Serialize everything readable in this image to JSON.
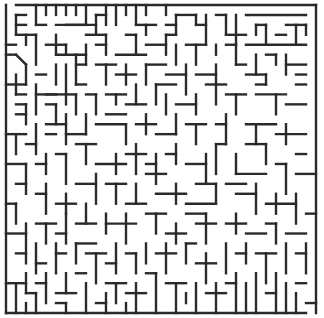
{
  "maze": {
    "origin": [
      6,
      5
    ],
    "cell": 10,
    "cols": 31,
    "rows": 31,
    "wall_color": "#2a2a2a",
    "entrance": {
      "side": "top",
      "col": 0
    },
    "exit": {
      "side": "bottom",
      "col": 30
    },
    "walls": [
      [
        1,
        0,
        31,
        0
      ],
      [
        31,
        0,
        31,
        31
      ],
      [
        0,
        0,
        0,
        31
      ],
      [
        0,
        31,
        30,
        31
      ],
      [
        1,
        1,
        2,
        1
      ],
      [
        1,
        1,
        1,
        3
      ],
      [
        1,
        2,
        2,
        2
      ],
      [
        1,
        3,
        3,
        3
      ],
      [
        3,
        0,
        3,
        2
      ],
      [
        3,
        2,
        4,
        2
      ],
      [
        4,
        0,
        4,
        1
      ],
      [
        5,
        0,
        5,
        1
      ],
      [
        6,
        0,
        6,
        1
      ],
      [
        7,
        0,
        7,
        1
      ],
      [
        8,
        0,
        8,
        2
      ],
      [
        8,
        2,
        6,
        2
      ],
      [
        5,
        2,
        9,
        2
      ],
      [
        9,
        1,
        9,
        3
      ],
      [
        8,
        3,
        10,
        3
      ],
      [
        9,
        1,
        10,
        1
      ],
      [
        10,
        0,
        10,
        2
      ],
      [
        11,
        0,
        11,
        2
      ],
      [
        12,
        0,
        12,
        1
      ],
      [
        13,
        0,
        13,
        2
      ],
      [
        14,
        0,
        14,
        1
      ],
      [
        13,
        2,
        15,
        2
      ],
      [
        14,
        2,
        14,
        3
      ],
      [
        16,
        0,
        16,
        1
      ],
      [
        16,
        2,
        17,
        2
      ],
      [
        17,
        1,
        17,
        3
      ],
      [
        17,
        1,
        19,
        1
      ],
      [
        19,
        1,
        19,
        2
      ],
      [
        19,
        2,
        20,
        2
      ],
      [
        20,
        1,
        20,
        4
      ],
      [
        21,
        1,
        22,
        1
      ],
      [
        22,
        1,
        22,
        3
      ],
      [
        23,
        1,
        23,
        4
      ],
      [
        22,
        3,
        24,
        3
      ],
      [
        24,
        1,
        30,
        1
      ],
      [
        25,
        2,
        26,
        2
      ],
      [
        25,
        2,
        25,
        3
      ],
      [
        26,
        2,
        26,
        4
      ],
      [
        27,
        3,
        28,
        3
      ],
      [
        28,
        2,
        30,
        2
      ],
      [
        29,
        2,
        29,
        4
      ],
      [
        30,
        2,
        30,
        3
      ],
      [
        24,
        4,
        30,
        4
      ],
      [
        0,
        4,
        1,
        4
      ],
      [
        2,
        3,
        2,
        4
      ],
      [
        3,
        3,
        3,
        6
      ],
      [
        4,
        4,
        6,
        4
      ],
      [
        5,
        3,
        5,
        4
      ],
      [
        5,
        4,
        5,
        5
      ],
      [
        5,
        5,
        8,
        5
      ],
      [
        6,
        4,
        6,
        5
      ],
      [
        8,
        4,
        8,
        6
      ],
      [
        9,
        4,
        10,
        4
      ],
      [
        10,
        3,
        10,
        5
      ],
      [
        12,
        3,
        13,
        3
      ],
      [
        13,
        3,
        13,
        5
      ],
      [
        11,
        5,
        14,
        5
      ],
      [
        14,
        4,
        16,
        4
      ],
      [
        16,
        3,
        17,
        3
      ],
      [
        16,
        3,
        16,
        5
      ],
      [
        17,
        4,
        17,
        6
      ],
      [
        18,
        4,
        20,
        4
      ],
      [
        19,
        4,
        19,
        6
      ],
      [
        21,
        4,
        21,
        5
      ],
      [
        22,
        4,
        23,
        4
      ],
      [
        23,
        4,
        23,
        6
      ],
      [
        0,
        5,
        1,
        5
      ],
      [
        1,
        5,
        2,
        6
      ],
      [
        2,
        6,
        2,
        8
      ],
      [
        3,
        7,
        4,
        7
      ],
      [
        1,
        7,
        1,
        9
      ],
      [
        1,
        9,
        2,
        9
      ],
      [
        3,
        8,
        3,
        11
      ],
      [
        4,
        9,
        6,
        9
      ],
      [
        6,
        6,
        6,
        10
      ],
      [
        5,
        6,
        5,
        8
      ],
      [
        7,
        5,
        7,
        8
      ],
      [
        7,
        6,
        8,
        6
      ],
      [
        9,
        6,
        11,
        6
      ],
      [
        10,
        6,
        10,
        8
      ],
      [
        11,
        7,
        13,
        7
      ],
      [
        12,
        6,
        12,
        8
      ],
      [
        14,
        6,
        16,
        6
      ],
      [
        14,
        6,
        14,
        8
      ],
      [
        16,
        7,
        18,
        7
      ],
      [
        18,
        6,
        18,
        9
      ],
      [
        19,
        7,
        21,
        7
      ],
      [
        21,
        6,
        21,
        8
      ],
      [
        23,
        6,
        24,
        6
      ],
      [
        25,
        5,
        25,
        7
      ],
      [
        26,
        5,
        27,
        5
      ],
      [
        27,
        5,
        27,
        6
      ],
      [
        28,
        5,
        28,
        7
      ],
      [
        28,
        6,
        30,
        6
      ],
      [
        29,
        7,
        30,
        7
      ],
      [
        24,
        7,
        26,
        7
      ],
      [
        26,
        7,
        26,
        8
      ],
      [
        0,
        8,
        2,
        8
      ],
      [
        3,
        9,
        5,
        9
      ],
      [
        4,
        10,
        5,
        10
      ],
      [
        5,
        10,
        5,
        12
      ],
      [
        4,
        12,
        6,
        12
      ],
      [
        7,
        8,
        8,
        8
      ],
      [
        6,
        9,
        7,
        9
      ],
      [
        7,
        9,
        7,
        11
      ],
      [
        8,
        9,
        9,
        9
      ],
      [
        9,
        9,
        9,
        11
      ],
      [
        10,
        9,
        12,
        9
      ],
      [
        11,
        9,
        11,
        10
      ],
      [
        12,
        10,
        14,
        10
      ],
      [
        13,
        8,
        13,
        10
      ],
      [
        15,
        8,
        17,
        8
      ],
      [
        15,
        8,
        15,
        10
      ],
      [
        16,
        9,
        16,
        11
      ],
      [
        17,
        10,
        19,
        10
      ],
      [
        19,
        9,
        19,
        11
      ],
      [
        20,
        8,
        22,
        8
      ],
      [
        21,
        8,
        21,
        10
      ],
      [
        22,
        9,
        24,
        9
      ],
      [
        23,
        9,
        23,
        11
      ],
      [
        25,
        8,
        26,
        8
      ],
      [
        25,
        9,
        28,
        9
      ],
      [
        27,
        9,
        27,
        11
      ],
      [
        28,
        10,
        30,
        10
      ],
      [
        29,
        8,
        30,
        8
      ],
      [
        1,
        10,
        2,
        10
      ],
      [
        2,
        10,
        2,
        12
      ],
      [
        1,
        11,
        2,
        11
      ],
      [
        0,
        13,
        2,
        13
      ],
      [
        1,
        13,
        1,
        15
      ],
      [
        2,
        14,
        3,
        14
      ],
      [
        3,
        12,
        3,
        15
      ],
      [
        4,
        13,
        5,
        13
      ],
      [
        6,
        11,
        6,
        14
      ],
      [
        6,
        13,
        8,
        13
      ],
      [
        8,
        11,
        8,
        13
      ],
      [
        9,
        12,
        12,
        12
      ],
      [
        10,
        11,
        12,
        11
      ],
      [
        12,
        12,
        12,
        14
      ],
      [
        13,
        12,
        15,
        12
      ],
      [
        14,
        11,
        14,
        13
      ],
      [
        15,
        13,
        17,
        13
      ],
      [
        17,
        11,
        17,
        13
      ],
      [
        18,
        12,
        20,
        12
      ],
      [
        19,
        12,
        19,
        14
      ],
      [
        21,
        12,
        22,
        12
      ],
      [
        22,
        11,
        22,
        14
      ],
      [
        24,
        12,
        27,
        12
      ],
      [
        25,
        12,
        25,
        14
      ],
      [
        27,
        13,
        30,
        13
      ],
      [
        28,
        12,
        28,
        14
      ],
      [
        29,
        15,
        30,
        15
      ],
      [
        0,
        16,
        2,
        16
      ],
      [
        2,
        16,
        2,
        19
      ],
      [
        1,
        18,
        2,
        18
      ],
      [
        3,
        16,
        4,
        16
      ],
      [
        4,
        15,
        4,
        17
      ],
      [
        5,
        15,
        6,
        15
      ],
      [
        6,
        15,
        6,
        18
      ],
      [
        7,
        14,
        9,
        14
      ],
      [
        8,
        14,
        8,
        16
      ],
      [
        9,
        16,
        12,
        16
      ],
      [
        11,
        15,
        11,
        17
      ],
      [
        12,
        15,
        14,
        15
      ],
      [
        13,
        14,
        13,
        17
      ],
      [
        14,
        16,
        15,
        16
      ],
      [
        15,
        15,
        15,
        18
      ],
      [
        16,
        15,
        17,
        15
      ],
      [
        17,
        14,
        17,
        16
      ],
      [
        18,
        16,
        20,
        16
      ],
      [
        20,
        15,
        20,
        18
      ],
      [
        21,
        14,
        22,
        14
      ],
      [
        21,
        14,
        21,
        17
      ],
      [
        23,
        15,
        23,
        17
      ],
      [
        23,
        17,
        26,
        17
      ],
      [
        24,
        14,
        26,
        14
      ],
      [
        26,
        14,
        26,
        16
      ],
      [
        27,
        16,
        28,
        16
      ],
      [
        28,
        16,
        28,
        19
      ],
      [
        29,
        17,
        31,
        17
      ],
      [
        0,
        20,
        1,
        20
      ],
      [
        1,
        20,
        1,
        22
      ],
      [
        3,
        19,
        4,
        19
      ],
      [
        4,
        18,
        4,
        21
      ],
      [
        5,
        20,
        7,
        20
      ],
      [
        6,
        19,
        6,
        21
      ],
      [
        7,
        18,
        9,
        18
      ],
      [
        9,
        17,
        9,
        20
      ],
      [
        10,
        18,
        12,
        18
      ],
      [
        11,
        18,
        11,
        20
      ],
      [
        12,
        20,
        14,
        20
      ],
      [
        13,
        18,
        13,
        20
      ],
      [
        14,
        17,
        16,
        17
      ],
      [
        15,
        19,
        18,
        19
      ],
      [
        17,
        18,
        17,
        20
      ],
      [
        18,
        20,
        21,
        20
      ],
      [
        19,
        18,
        21,
        18
      ],
      [
        21,
        18,
        21,
        20
      ],
      [
        22,
        18,
        24,
        18
      ],
      [
        23,
        19,
        25,
        19
      ],
      [
        25,
        18,
        25,
        21
      ],
      [
        26,
        20,
        29,
        20
      ],
      [
        27,
        19,
        27,
        21
      ],
      [
        29,
        19,
        29,
        22
      ],
      [
        30,
        21,
        31,
        21
      ],
      [
        0,
        23,
        2,
        23
      ],
      [
        2,
        22,
        2,
        26
      ],
      [
        3,
        22,
        5,
        22
      ],
      [
        4,
        22,
        4,
        24
      ],
      [
        5,
        23,
        6,
        23
      ],
      [
        6,
        21,
        6,
        24
      ],
      [
        7,
        22,
        9,
        22
      ],
      [
        8,
        20,
        8,
        22
      ],
      [
        10,
        21,
        10,
        23
      ],
      [
        10,
        22,
        13,
        22
      ],
      [
        12,
        21,
        12,
        24
      ],
      [
        14,
        21,
        16,
        21
      ],
      [
        15,
        21,
        15,
        23
      ],
      [
        16,
        23,
        18,
        23
      ],
      [
        17,
        22,
        17,
        24
      ],
      [
        18,
        21,
        20,
        21
      ],
      [
        19,
        22,
        21,
        22
      ],
      [
        20,
        21,
        20,
        24
      ],
      [
        22,
        22,
        24,
        22
      ],
      [
        23,
        21,
        23,
        23
      ],
      [
        24,
        23,
        26,
        23
      ],
      [
        26,
        22,
        27,
        22
      ],
      [
        27,
        22,
        27,
        24
      ],
      [
        28,
        23,
        30,
        23
      ],
      [
        1,
        25,
        2,
        25
      ],
      [
        3,
        24,
        3,
        27
      ],
      [
        3,
        26,
        4,
        26
      ],
      [
        5,
        25,
        6,
        25
      ],
      [
        5,
        24,
        5,
        27
      ],
      [
        7,
        24,
        7,
        26
      ],
      [
        7,
        24,
        9,
        24
      ],
      [
        8,
        25,
        10,
        25
      ],
      [
        9,
        25,
        9,
        28
      ],
      [
        10,
        26,
        11,
        26
      ],
      [
        11,
        24,
        11,
        27
      ],
      [
        12,
        25,
        13,
        25
      ],
      [
        13,
        25,
        13,
        27
      ],
      [
        14,
        24,
        14,
        26
      ],
      [
        15,
        25,
        17,
        25
      ],
      [
        16,
        24,
        16,
        27
      ],
      [
        18,
        24,
        19,
        24
      ],
      [
        18,
        24,
        18,
        26
      ],
      [
        19,
        26,
        21,
        26
      ],
      [
        20,
        25,
        20,
        28
      ],
      [
        22,
        24,
        22,
        27
      ],
      [
        23,
        25,
        24,
        25
      ],
      [
        24,
        24,
        24,
        26
      ],
      [
        25,
        25,
        27,
        25
      ],
      [
        26,
        25,
        26,
        28
      ],
      [
        28,
        24,
        28,
        27
      ],
      [
        29,
        25,
        30,
        25
      ],
      [
        30,
        24,
        30,
        27
      ],
      [
        0,
        28,
        2,
        28
      ],
      [
        1,
        28,
        1,
        31
      ],
      [
        2,
        27,
        2,
        29
      ],
      [
        3,
        28,
        4,
        28
      ],
      [
        4,
        27,
        4,
        30
      ],
      [
        5,
        29,
        7,
        29
      ],
      [
        6,
        27,
        6,
        29
      ],
      [
        7,
        27,
        8,
        27
      ],
      [
        8,
        28,
        8,
        31
      ],
      [
        10,
        28,
        12,
        28
      ],
      [
        11,
        28,
        11,
        30
      ],
      [
        12,
        29,
        14,
        29
      ],
      [
        13,
        28,
        13,
        31
      ],
      [
        14,
        27,
        15,
        27
      ],
      [
        15,
        27,
        15,
        31
      ],
      [
        16,
        28,
        18,
        28
      ],
      [
        17,
        28,
        17,
        31
      ],
      [
        19,
        28,
        19,
        31
      ],
      [
        20,
        29,
        22,
        29
      ],
      [
        21,
        28,
        21,
        31
      ],
      [
        22,
        28,
        23,
        28
      ],
      [
        23,
        27,
        23,
        31
      ],
      [
        24,
        28,
        24,
        31
      ],
      [
        25,
        27,
        25,
        31
      ],
      [
        26,
        29,
        27,
        29
      ],
      [
        27,
        27,
        27,
        31
      ],
      [
        28,
        28,
        28,
        31
      ],
      [
        29,
        28,
        30,
        28
      ],
      [
        29,
        29,
        29,
        31
      ],
      [
        30,
        30,
        31,
        30
      ],
      [
        2,
        29,
        3,
        29
      ],
      [
        3,
        29,
        3,
        31
      ],
      [
        2,
        30,
        2,
        31
      ],
      [
        5,
        30,
        6,
        30
      ],
      [
        6,
        30,
        6,
        31
      ],
      [
        9,
        30,
        10,
        30
      ],
      [
        10,
        29,
        10,
        31
      ],
      [
        12,
        30,
        12,
        31
      ],
      [
        18,
        29,
        18,
        30
      ]
    ]
  }
}
